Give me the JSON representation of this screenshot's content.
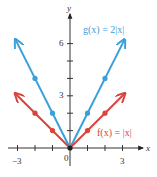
{
  "chart_data": {
    "type": "line",
    "title": "",
    "xlabel": "x",
    "ylabel": "y",
    "xlim": [
      -3.5,
      4.2
    ],
    "ylim": [
      -0.6,
      7.6
    ],
    "grid": false,
    "x_ticks": [
      -3,
      -2,
      -1,
      1,
      2,
      3
    ],
    "x_tick_labels": {
      "-3": "−3",
      "0": "0",
      "3": "3"
    },
    "y_ticks": [
      1,
      2,
      3,
      4,
      5,
      6
    ],
    "y_tick_labels": {
      "3": "3",
      "6": "6"
    },
    "series": [
      {
        "name": "g(x) = 2|x|",
        "label": "g(x) = 2|x|",
        "color": "#3aa0d8",
        "x": [
          -3.1,
          -2,
          -1,
          0,
          1,
          2,
          3.1
        ],
        "y": [
          6.2,
          4,
          2,
          0,
          2,
          4,
          6.2
        ],
        "marked_points": [
          [
            -2,
            4
          ],
          [
            -1,
            2
          ],
          [
            0,
            0
          ],
          [
            1,
            2
          ],
          [
            2,
            4
          ]
        ],
        "arrows_at_ends": true
      },
      {
        "name": "f(x) = |x|",
        "label": "f(x) = |x|",
        "color": "#d9443c",
        "x": [
          -3.1,
          -2,
          -1,
          0,
          1,
          2,
          3.1
        ],
        "y": [
          3.1,
          2,
          1,
          0,
          1,
          2,
          3.1
        ],
        "marked_points": [
          [
            -2,
            2
          ],
          [
            -1,
            1
          ],
          [
            0,
            0
          ],
          [
            1,
            1
          ],
          [
            2,
            2
          ]
        ],
        "arrows_at_ends": true
      }
    ],
    "legend_position": "inline labels"
  },
  "labels": {
    "x_axis": "x",
    "y_axis": "y",
    "origin": "0",
    "x_neg3": "−3",
    "x_3": "3",
    "y_3": "3",
    "y_6": "6",
    "g_label": "g(x) = 2|x|",
    "f_label": "f(x) = |x|"
  },
  "colors": {
    "axis": "#333333",
    "g": "#3aa0d8",
    "f": "#d9443c",
    "origin_point": "#222222"
  }
}
